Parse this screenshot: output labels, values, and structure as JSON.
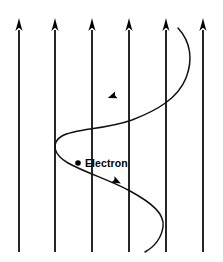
{
  "figure": {
    "background_color": "#ffffff",
    "width": 223,
    "height": 262
  },
  "field": {
    "label": "magnetic-field-lines",
    "count": 6,
    "direction": "up",
    "stroke_color": "#000000",
    "stroke_width": 1.7,
    "line_top_y": 18,
    "line_bottom_y": 252,
    "x_positions": [
      19,
      55,
      92,
      129,
      166,
      203
    ],
    "arrowhead": {
      "width": 7.5,
      "height": 13,
      "tip_y": 18
    }
  },
  "particle": {
    "label": "Electron",
    "marker_shape": "filled-circle",
    "marker_color": "#000000",
    "marker_radius": 2.8,
    "marker_x": 78,
    "marker_y": 163,
    "label_x": 85,
    "label_y": 167
  },
  "trajectory": {
    "label": "electron-helical-path",
    "stroke_color": "#111111",
    "stroke_width": 1.5,
    "path": "M 178 28 C 191 42 193 60 186 78 C 178 98 158 110 132 120 C 104 130 76 128 62 136 C 50 143 54 155 68 163 C 86 173 110 180 130 191 C 152 203 165 214 163 227 C 161 240 152 248 145 252",
    "direction_markers": [
      {
        "name": "upper-direction-arrow",
        "x": 113,
        "y": 96,
        "angle": 160
      },
      {
        "name": "lower-direction-arrow",
        "x": 116,
        "y": 181,
        "angle": 28
      }
    ]
  }
}
